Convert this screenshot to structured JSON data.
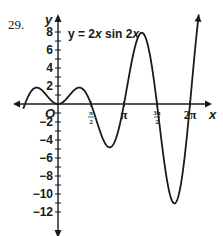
{
  "problem_number": "29.",
  "chart_data": {
    "type": "line",
    "title": "y = 2x sin 2x",
    "equation_parts": {
      "lhs": "y = 2",
      "x1": "x",
      "mid": " sin 2",
      "x2": "x"
    },
    "xlabel": "x",
    "ylabel": "y",
    "origin_label": "O",
    "xlim": [
      -1.4,
      7.0
    ],
    "ylim": [
      -13,
      9
    ],
    "x_ticks": [
      {
        "value": 1.5708,
        "label": "π/2",
        "num": "π",
        "den": "2"
      },
      {
        "value": 3.1416,
        "label": "π"
      },
      {
        "value": 4.7124,
        "label": "3π/2",
        "num": "3π",
        "den": "2"
      },
      {
        "value": 6.2832,
        "label": "2π"
      }
    ],
    "y_ticks": [
      8,
      6,
      4,
      2,
      -2,
      -4,
      -6,
      -8,
      -10,
      -12
    ],
    "series": [
      {
        "name": "y = 2x sin 2x",
        "function": "2*x*sin(2*x)",
        "domain": [
          -1.65,
          6.7
        ],
        "key_points": [
          {
            "x": -1.14,
            "y": 1.82
          },
          {
            "x": 0,
            "y": 0
          },
          {
            "x": 1.14,
            "y": 1.82
          },
          {
            "x": 1.5708,
            "y": 0
          },
          {
            "x": 2.29,
            "y": -4.55
          },
          {
            "x": 3.1416,
            "y": 0
          },
          {
            "x": 3.86,
            "y": 7.7
          },
          {
            "x": 4.7124,
            "y": 0
          },
          {
            "x": 5.44,
            "y": -10.8
          },
          {
            "x": 6.2832,
            "y": 0
          }
        ]
      }
    ],
    "grid": false,
    "legend": "none"
  },
  "colors": {
    "axis": "#1a1a1a",
    "curve": "#1a1a1a",
    "background": "#ffffff"
  }
}
